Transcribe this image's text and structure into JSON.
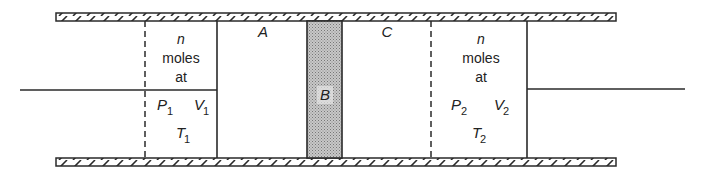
{
  "diagram": {
    "type": "piston-cylinder",
    "left_chamber": {
      "line1": "n",
      "line2": "moles",
      "line3": "at",
      "pressure": "P",
      "pressure_sub": "1",
      "volume": "V",
      "volume_sub": "1",
      "temperature": "T",
      "temperature_sub": "1"
    },
    "region_a": "A",
    "region_b": "B",
    "region_c": "C",
    "right_chamber": {
      "line1": "n",
      "line2": "moles",
      "line3": "at",
      "pressure": "P",
      "pressure_sub": "2",
      "volume": "V",
      "volume_sub": "2",
      "temperature": "T",
      "temperature_sub": "2"
    },
    "colors": {
      "line": "#2a2a2a",
      "barrier_fill": "#b8b8b8"
    }
  }
}
